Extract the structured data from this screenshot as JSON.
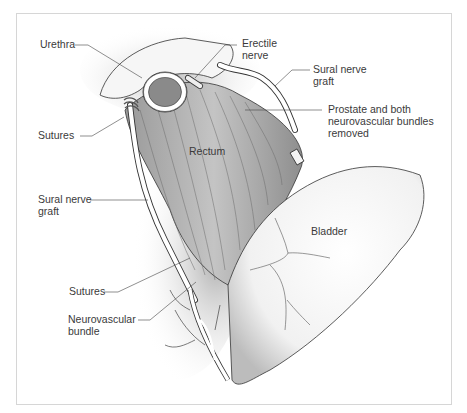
{
  "figure": {
    "type": "anatomical-illustration",
    "labels": {
      "urethra": "Urethra",
      "erectile_nerve_1": "Erectile",
      "erectile_nerve_2": "nerve",
      "sural_graft_top_1": "Sural nerve",
      "sural_graft_top_2": "graft",
      "prostate_1": "Prostate and both",
      "prostate_2": "neurovascular bundles",
      "prostate_3": "removed",
      "sutures_top": "Sutures",
      "rectum": "Rectum",
      "sural_graft_left_1": "Sural nerve",
      "sural_graft_left_2": "graft",
      "bladder": "Bladder",
      "sutures_bottom": "Sutures",
      "nvb_1": "Neurovascular",
      "nvb_2": "bundle"
    }
  }
}
